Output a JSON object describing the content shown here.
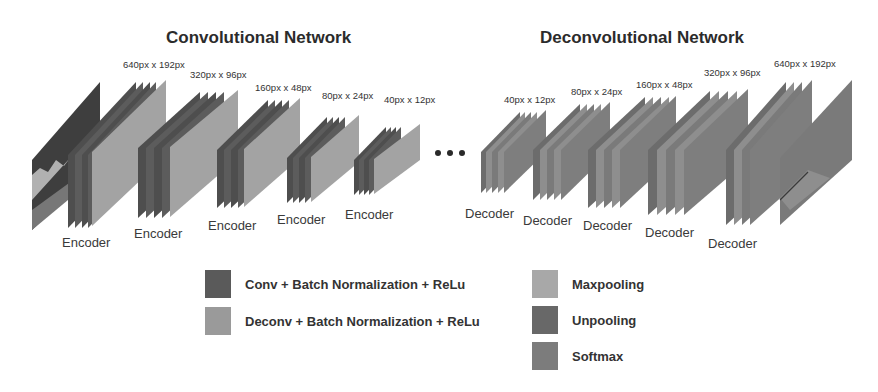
{
  "titles": {
    "encoder_network": "Convolutional Network",
    "decoder_network": "Deconvolutional Network"
  },
  "encoder": {
    "blocks": [
      {
        "label": "Encoder",
        "size": "640px x 192px"
      },
      {
        "label": "Encoder",
        "size": "320px x 96px"
      },
      {
        "label": "Encoder",
        "size": "160px x 48px"
      },
      {
        "label": "Encoder",
        "size": "80px x 24px"
      },
      {
        "label": "Encoder",
        "size": "40px x 12px"
      }
    ]
  },
  "decoder": {
    "blocks": [
      {
        "label": "Decoder",
        "size": "40px x 12px"
      },
      {
        "label": "Decoder",
        "size": "80px x 24px"
      },
      {
        "label": "Decoder",
        "size": "160px x 48px"
      },
      {
        "label": "Decoder",
        "size": "320px x 96px"
      },
      {
        "label": "Decoder",
        "size": "640px x 192px"
      }
    ]
  },
  "ellipsis": "...",
  "legend": {
    "items": [
      {
        "label": "Conv + Batch Normalization + ReLu",
        "color": "#5a5a5a"
      },
      {
        "label": "Deconv + Batch Normalization + ReLu",
        "color": "#9a9a9a"
      },
      {
        "label": "Maxpooling",
        "color": "#a8a8a8"
      },
      {
        "label": "Unpooling",
        "color": "#686868"
      },
      {
        "label": "Softmax",
        "color": "#7c7c7c"
      }
    ]
  },
  "colors": {
    "conv": "#5a5a5a",
    "conv_edge": "#4a4a4a",
    "deconv": "#8e8e8e",
    "maxpool": "#a3a3a3",
    "unpool": "#6c6c6c",
    "softmax": "#7a7a7a",
    "input": "#3c3c3c"
  }
}
